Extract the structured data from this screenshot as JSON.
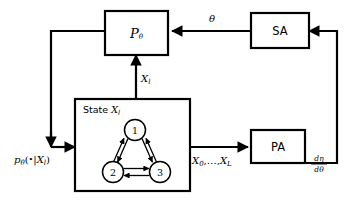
{
  "figure": {
    "type": "block-diagram",
    "title": "",
    "background_color": "#ffffff",
    "line_color": "#000000"
  },
  "blocks": {
    "ptheta": {
      "label": "P",
      "subscript": "θ",
      "name": "P-theta"
    },
    "sa": {
      "label": "SA",
      "name": "SA"
    },
    "pa": {
      "label": "PA",
      "name": "PA"
    },
    "state": {
      "caption_prefix": "State ",
      "caption_var": "X",
      "caption_sub": "l",
      "name": "State X_l"
    }
  },
  "markov_chain": {
    "nodes": [
      {
        "id": "1",
        "label": "1"
      },
      {
        "id": "2",
        "label": "2"
      },
      {
        "id": "3",
        "label": "3"
      }
    ],
    "edges": [
      {
        "from": "1",
        "to": "2",
        "bidirectional": true
      },
      {
        "from": "1",
        "to": "3",
        "bidirectional": true
      },
      {
        "from": "2",
        "to": "3",
        "bidirectional": true
      }
    ]
  },
  "edge_labels": {
    "theta": "θ",
    "x_l": {
      "base": "X",
      "sub": "l"
    },
    "x_sequence": {
      "text": "X",
      "sub_first": "0",
      "mid": ",…,",
      "base_last": "X",
      "sub_last": "L"
    },
    "p_conditional": {
      "base": "p",
      "sub": "θ",
      "open": "(",
      "bullet": "•",
      "bar": "|",
      "var": "X",
      "var_sub": "l",
      "close": ")"
    },
    "derivative": {
      "numerator_d": "d",
      "numerator_var": "η",
      "denominator_d": "d",
      "denominator_var": "θ"
    }
  },
  "flows": [
    {
      "name": "sa-to-ptheta",
      "label": "θ"
    },
    {
      "name": "state-to-ptheta",
      "label": "X_l"
    },
    {
      "name": "ptheta-to-state",
      "label": "p_theta(•|X_l)"
    },
    {
      "name": "state-to-pa",
      "label": "X_0,…,X_L"
    },
    {
      "name": "pa-to-sa",
      "label": "dη/dθ"
    }
  ]
}
